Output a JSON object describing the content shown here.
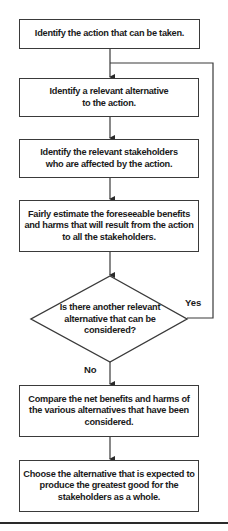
{
  "flowchart": {
    "steps": [
      {
        "id": "identify-action",
        "text": "Identify the action that can be taken."
      },
      {
        "id": "identify-alternative",
        "text": "Identify a relevant alternative to the action."
      },
      {
        "id": "identify-stakeholders",
        "text": "Identify the relevant stakeholders who are affected by the action."
      },
      {
        "id": "estimate-benefits-harms",
        "text": "Fairly estimate the foreseeable benefits and harms that will result from the action to all the stakeholders."
      },
      {
        "id": "compare-alternatives",
        "text": "Compare the net benefits and harms of the various alternatives that have been considered."
      },
      {
        "id": "choose-alternative",
        "text": "Choose the alternative that is expected to produce the greatest good for the stakeholders as a whole."
      }
    ],
    "decision": {
      "text": "Is there another relevant alternative that can be considered?",
      "yes_label": "Yes",
      "no_label": "No"
    }
  },
  "colors": {
    "line": "#3a3a3a",
    "text": "#1a1a1a",
    "background": "#ffffff"
  }
}
